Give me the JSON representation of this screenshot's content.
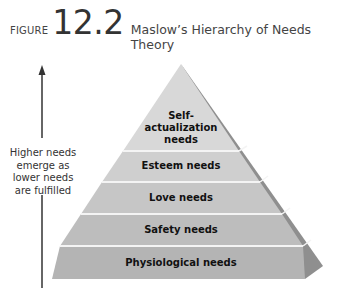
{
  "figure": {
    "label": "FIGURE",
    "number": "12.2",
    "title": "Maslow’s Hierarchy of Needs Theory"
  },
  "arrow": {
    "lines": [
      "Higher needs",
      "emerge as",
      "lower needs",
      "are fulfilled"
    ]
  },
  "pyramid": {
    "levels": [
      {
        "label_lines": [
          "Self-",
          "actualization",
          "needs"
        ],
        "color": "#d6d6d6"
      },
      {
        "label_lines": [
          "Esteem needs"
        ],
        "color": "#cdcdcd"
      },
      {
        "label_lines": [
          "Love needs"
        ],
        "color": "#c4c4c4"
      },
      {
        "label_lines": [
          "Safety needs"
        ],
        "color": "#bcbcbc"
      },
      {
        "label_lines": [
          "Physiological needs"
        ],
        "color": "#b3b3b3"
      }
    ],
    "side_color": "#8c8c8c",
    "separator_color": "#f2f2f2"
  },
  "caption_cut": "Source: (text cut off at bottom of image)"
}
